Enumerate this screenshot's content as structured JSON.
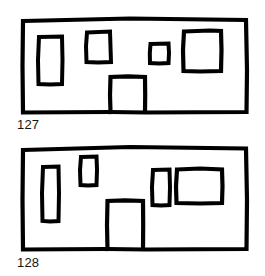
{
  "page": {
    "background_color": "#ffffff",
    "ink_color": "#000000",
    "width": 265,
    "height": 276
  },
  "figures": [
    {
      "caption": "127",
      "drawing_name": "building-facade-127",
      "outline": {
        "name": "facade-outline",
        "x": 22,
        "y": 18,
        "width": 225,
        "height": 94,
        "stroke_width": 4
      },
      "shapes": [
        {
          "name": "window-tall-left",
          "x": 38,
          "y": 36,
          "width": 24,
          "height": 48,
          "stroke_width": 4,
          "open_bottom": false
        },
        {
          "name": "window-upper-mid-left",
          "x": 86,
          "y": 31,
          "width": 25,
          "height": 31,
          "stroke_width": 4,
          "open_bottom": false
        },
        {
          "name": "window-small-center",
          "x": 150,
          "y": 43,
          "width": 19,
          "height": 20,
          "stroke_width": 4,
          "open_bottom": false
        },
        {
          "name": "window-large-right",
          "x": 183,
          "y": 30,
          "width": 38,
          "height": 41,
          "stroke_width": 4,
          "open_bottom": false
        },
        {
          "name": "door-center",
          "x": 110,
          "y": 76,
          "width": 35,
          "height": 36,
          "stroke_width": 4,
          "open_bottom": true
        }
      ]
    },
    {
      "caption": "128",
      "drawing_name": "building-facade-128",
      "outline": {
        "name": "facade-outline",
        "x": 22,
        "y": 147,
        "width": 225,
        "height": 102,
        "stroke_width": 4
      },
      "shapes": [
        {
          "name": "window-tall-narrow-left",
          "x": 42,
          "y": 166,
          "width": 17,
          "height": 55,
          "stroke_width": 4,
          "open_bottom": false
        },
        {
          "name": "window-upper-left",
          "x": 80,
          "y": 156,
          "width": 17,
          "height": 29,
          "stroke_width": 4,
          "open_bottom": false
        },
        {
          "name": "window-narrow-right",
          "x": 152,
          "y": 169,
          "width": 18,
          "height": 36,
          "stroke_width": 4,
          "open_bottom": false
        },
        {
          "name": "window-wide-right",
          "x": 176,
          "y": 168,
          "width": 46,
          "height": 35,
          "stroke_width": 4,
          "open_bottom": false
        },
        {
          "name": "door-center",
          "x": 107,
          "y": 200,
          "width": 36,
          "height": 49,
          "stroke_width": 4,
          "open_bottom": true
        }
      ]
    }
  ]
}
